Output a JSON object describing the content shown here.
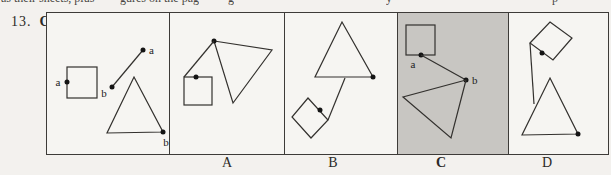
{
  "page": {
    "bg": "#f3f1ee",
    "panel_bg": "#f6f5f2",
    "highlight_bg": "#c8c6c2",
    "border_color": "#3d3b38"
  },
  "top_strip": {
    "fragments": [
      {
        "text": "as their sheets, plus",
        "x": 1
      },
      {
        "text": "gures on the pag",
        "x": 120
      },
      {
        "text": "g",
        "x": 228
      },
      {
        "text": "y",
        "x": 386
      },
      {
        "text": "p",
        "x": 552
      }
    ]
  },
  "question": {
    "number": "13.",
    "answer": "C"
  },
  "board": {
    "cells": [
      {
        "id": "example",
        "w": 123
      },
      {
        "id": "A",
        "w": 115
      },
      {
        "id": "B",
        "w": 113
      },
      {
        "id": "C",
        "w": 111,
        "bg": "#c8c6c2"
      },
      {
        "id": "D",
        "w": 100
      }
    ]
  },
  "answer_row": {
    "options": [
      {
        "label": "A",
        "x": 227,
        "bold": false
      },
      {
        "label": "B",
        "x": 333,
        "bold": false
      },
      {
        "label": "C",
        "x": 441,
        "bold": true
      },
      {
        "label": "D",
        "x": 547,
        "bold": false
      }
    ]
  },
  "figures": {
    "stroke": "#33312e",
    "stroke_w": 1.2,
    "dot_fill": "#141414",
    "dot_r": 2.5,
    "label_color": "#222222",
    "label_size": 11,
    "shapes": [
      {
        "t": "rect",
        "name": "example-square",
        "x": 67,
        "y": 67,
        "w": 30,
        "h": 31
      },
      {
        "t": "dot",
        "name": "example-square-dot",
        "cx": 67,
        "cy": 82
      },
      {
        "t": "label",
        "name": "example-label-a-square",
        "x": 58,
        "y": 86,
        "text": "a",
        "anchor": "middle"
      },
      {
        "t": "line",
        "name": "example-segment",
        "x1": 112,
        "y1": 87,
        "x2": 143,
        "y2": 50
      },
      {
        "t": "dot",
        "name": "example-segment-dot-b",
        "cx": 112,
        "cy": 87
      },
      {
        "t": "dot",
        "name": "example-segment-dot-a",
        "cx": 143,
        "cy": 50
      },
      {
        "t": "label",
        "name": "example-label-a-segment",
        "x": 149,
        "y": 54,
        "text": "a",
        "anchor": "start"
      },
      {
        "t": "label",
        "name": "example-label-b-segment",
        "x": 104,
        "y": 97,
        "text": "b",
        "anchor": "middle"
      },
      {
        "t": "poly",
        "name": "example-triangle",
        "pts": "134,77 163,132 107,133"
      },
      {
        "t": "dot",
        "name": "example-triangle-dot",
        "cx": 163,
        "cy": 132
      },
      {
        "t": "label",
        "name": "example-label-b-triangle",
        "x": 166,
        "y": 146,
        "text": "b",
        "anchor": "middle"
      },
      {
        "t": "poly",
        "name": "optionA-triangle",
        "pts": "214,41 272,50 233,103"
      },
      {
        "t": "dot",
        "name": "optionA-triangle-dot",
        "cx": 214,
        "cy": 41
      },
      {
        "t": "line",
        "name": "optionA-segment",
        "x1": 214,
        "y1": 41,
        "x2": 184,
        "y2": 77
      },
      {
        "t": "rect",
        "name": "optionA-square",
        "x": 184,
        "y": 77,
        "w": 28,
        "h": 28
      },
      {
        "t": "dot",
        "name": "optionA-square-dot",
        "cx": 196,
        "cy": 77
      },
      {
        "t": "poly",
        "name": "optionB-triangle",
        "pts": "342,22 373,77 315,77"
      },
      {
        "t": "dot",
        "name": "optionB-triangle-dot",
        "cx": 373,
        "cy": 77
      },
      {
        "t": "line",
        "name": "optionB-segment",
        "x1": 345,
        "y1": 78,
        "x2": 328,
        "y2": 120
      },
      {
        "t": "poly",
        "name": "optionB-rotated-square",
        "pts": "308,98 328,120 311,138 292,117"
      },
      {
        "t": "dot",
        "name": "optionB-square-dot",
        "cx": 320,
        "cy": 110
      },
      {
        "t": "rect",
        "name": "optionC-square",
        "x": 406,
        "y": 25,
        "w": 29,
        "h": 30
      },
      {
        "t": "dot",
        "name": "optionC-square-dot",
        "cx": 421,
        "cy": 55
      },
      {
        "t": "label",
        "name": "optionC-label-a",
        "x": 413,
        "y": 68,
        "text": "a",
        "anchor": "middle"
      },
      {
        "t": "line",
        "name": "optionC-segment",
        "x1": 421,
        "y1": 55,
        "x2": 466,
        "y2": 80
      },
      {
        "t": "dot",
        "name": "optionC-segment-dot",
        "cx": 466,
        "cy": 80
      },
      {
        "t": "label",
        "name": "optionC-label-b",
        "x": 472,
        "y": 84,
        "text": "b",
        "anchor": "start"
      },
      {
        "t": "poly",
        "name": "optionC-triangle",
        "pts": "466,80 403,97 451,138"
      },
      {
        "t": "poly",
        "name": "optionD-rotated-square",
        "pts": "550,22 572,38 553,60 530,43"
      },
      {
        "t": "dot",
        "name": "optionD-square-dot",
        "cx": 542,
        "cy": 53
      },
      {
        "t": "line",
        "name": "optionD-segment",
        "x1": 530,
        "y1": 43,
        "x2": 534,
        "y2": 104
      },
      {
        "t": "poly",
        "name": "optionD-triangle",
        "pts": "550,78 578,134 522,135"
      },
      {
        "t": "dot",
        "name": "optionD-triangle-dot",
        "cx": 578,
        "cy": 134
      }
    ]
  }
}
